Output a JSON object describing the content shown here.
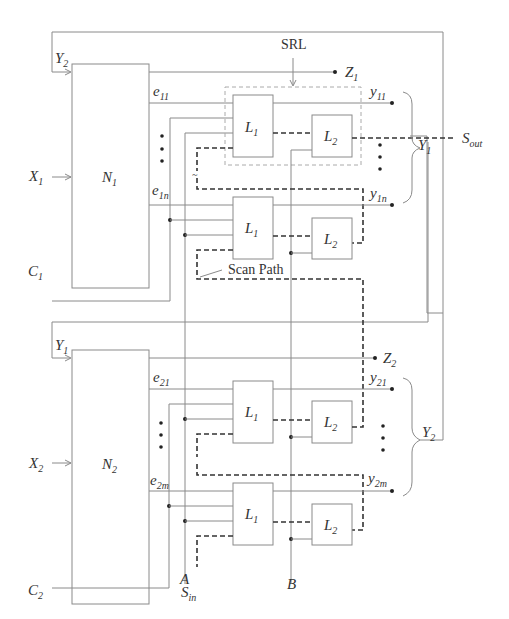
{
  "figure": {
    "networks": [
      {
        "id": "N1",
        "label": "N",
        "sub": "1",
        "input": {
          "label": "X",
          "sub": "1"
        },
        "feedback_in": {
          "label": "Y",
          "sub": "2"
        },
        "clock": {
          "label": "C",
          "sub": "1"
        },
        "primary_out": {
          "label": "Z",
          "sub": "1"
        },
        "e_first": {
          "label": "e",
          "sub": "11"
        },
        "e_last": {
          "label": "e",
          "sub": "1n"
        },
        "y_first": {
          "label": "y",
          "sub": "11"
        },
        "y_last": {
          "label": "y",
          "sub": "1n"
        },
        "bus": {
          "label": "Y",
          "sub": "1"
        }
      },
      {
        "id": "N2",
        "label": "N",
        "sub": "2",
        "input": {
          "label": "X",
          "sub": "2"
        },
        "feedback_in": {
          "label": "Y",
          "sub": "1"
        },
        "clock": {
          "label": "C",
          "sub": "2"
        },
        "primary_out": {
          "label": "Z",
          "sub": "2"
        },
        "e_first": {
          "label": "e",
          "sub": "21"
        },
        "e_last": {
          "label": "e",
          "sub": "2m"
        },
        "y_first": {
          "label": "y",
          "sub": "21"
        },
        "y_last": {
          "label": "y",
          "sub": "2m"
        },
        "bus": {
          "label": "Y",
          "sub": "2"
        }
      }
    ],
    "latch_L1": {
      "label": "L",
      "sub": "1"
    },
    "latch_L2": {
      "label": "L",
      "sub": "2"
    },
    "srl_label": "SRL",
    "scan_path_label": "Scan Path",
    "scan_out": {
      "label": "S",
      "sub": "out"
    },
    "scan_in": {
      "label": "S",
      "sub": "in"
    },
    "clock_A": "A",
    "clock_B": "B"
  }
}
